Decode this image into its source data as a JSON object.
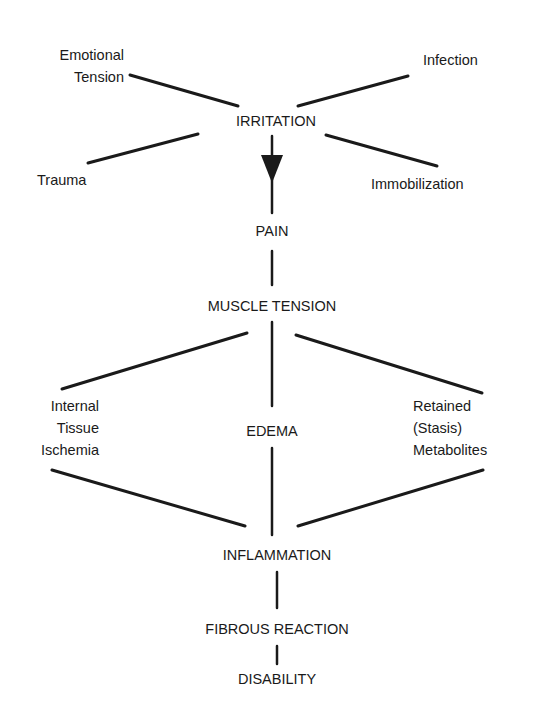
{
  "diagram": {
    "type": "flowchart",
    "nodes": {
      "emotional_tension": "Emotional\nTension",
      "infection": "Infection",
      "irritation": "IRRITATION",
      "trauma": "Trauma",
      "immobilization": "Immobilization",
      "pain": "PAIN",
      "muscle_tension": "MUSCLE TENSION",
      "internal_tissue_ischemia": "Internal\nTissue\nIschemia",
      "edema": "EDEMA",
      "retained_metabolites": "Retained\n(Stasis)\nMetabolites",
      "inflammation": "INFLAMMATION",
      "fibrous_reaction": "FIBROUS REACTION",
      "disability": "DISABILITY"
    },
    "edges": [
      [
        "Emotional Tension",
        "IRRITATION"
      ],
      [
        "Infection",
        "IRRITATION"
      ],
      [
        "Trauma",
        "IRRITATION"
      ],
      [
        "Immobilization",
        "IRRITATION"
      ],
      [
        "IRRITATION",
        "PAIN"
      ],
      [
        "PAIN",
        "MUSCLE TENSION"
      ],
      [
        "MUSCLE TENSION",
        "Internal Tissue Ischemia"
      ],
      [
        "MUSCLE TENSION",
        "EDEMA"
      ],
      [
        "MUSCLE TENSION",
        "Retained (Stasis) Metabolites"
      ],
      [
        "Internal Tissue Ischemia",
        "INFLAMMATION"
      ],
      [
        "EDEMA",
        "INFLAMMATION"
      ],
      [
        "Retained (Stasis) Metabolites",
        "INFLAMMATION"
      ],
      [
        "INFLAMMATION",
        "FIBROUS REACTION"
      ],
      [
        "FIBROUS REACTION",
        "DISABILITY"
      ]
    ],
    "colors": {
      "ink": "#1a1a1a",
      "background": "#ffffff"
    }
  }
}
